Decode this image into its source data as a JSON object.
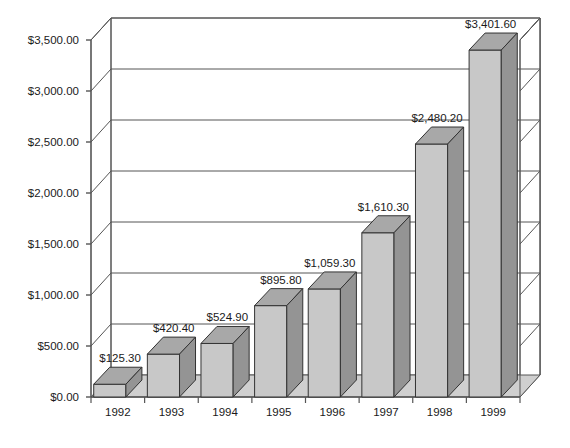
{
  "chart_data": {
    "type": "bar",
    "title": "",
    "subtitle": "",
    "xlabel": "",
    "ylabel": "",
    "categories": [
      "1992",
      "1993",
      "1994",
      "1995",
      "1996",
      "1997",
      "1998",
      "1999"
    ],
    "values": [
      125.3,
      420.4,
      524.9,
      895.8,
      1059.3,
      1610.3,
      2480.2,
      3401.6
    ],
    "data_labels": [
      "$125.30",
      "$420.40",
      "$524.90",
      "$895.80",
      "$1,059.30",
      "$1,610.30",
      "$2,480.20",
      "$3,401.60"
    ],
    "ylim": [
      0,
      3500
    ],
    "ytick_values": [
      0,
      500,
      1000,
      1500,
      2000,
      2500,
      3000,
      3500
    ],
    "ytick_labels": [
      "$0.00",
      "$500.00",
      "$1,000.00",
      "$1,500.00",
      "$2,000.00",
      "$2,500.00",
      "$3,000.00",
      "$3,500.00"
    ],
    "grid": true,
    "legend": false,
    "legend_position": "none",
    "style": "3d-column",
    "colors": {
      "bar_front": "#c8c8c8",
      "bar_side": "#949494",
      "bar_top": "#a8a8a8",
      "bar_outline": "#333333",
      "floor": "#cfcfcf",
      "wall": "#ffffff",
      "gridline": "#555555",
      "axis": "#555555",
      "text": "#1a1a1a",
      "background": "#ffffff"
    }
  }
}
